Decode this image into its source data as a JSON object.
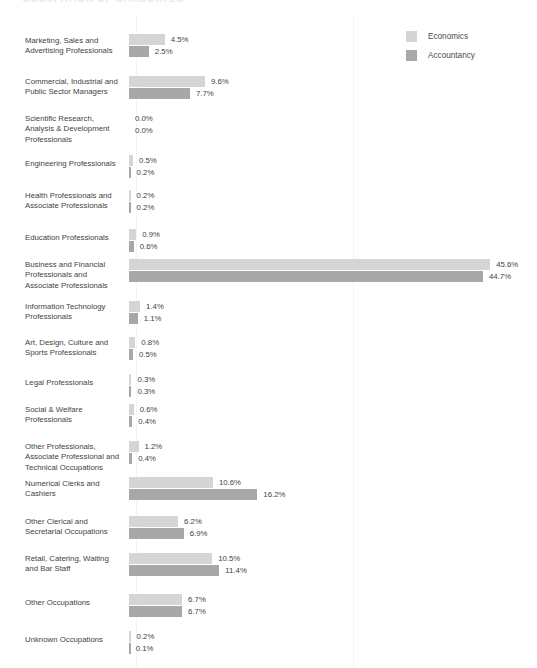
{
  "header": {
    "fragment_text": "OCCUPATION OF GRADUATES",
    "bullet_icon": "square-bullet-icon"
  },
  "legend": {
    "position": "top-right",
    "items": [
      {
        "label": "Economics",
        "color": "#d5d5d5",
        "swatch_icon": "legend-swatch-icon"
      },
      {
        "label": "Accountancy",
        "color": "#a8a8a8",
        "swatch_icon": "legend-swatch-icon"
      }
    ]
  },
  "chart_data": {
    "type": "bar",
    "orientation": "horizontal",
    "grouped": true,
    "title": "",
    "subtitle": "",
    "xlabel": "",
    "ylabel": "",
    "xlim": [
      0,
      50
    ],
    "grid": false,
    "legend_position": "top-right",
    "value_suffix": "%",
    "categories": [
      "Marketing, Sales and Advertising Professionals",
      "Commercial, Industrial and Public Sector Managers",
      "Scientific Research, Analysis & Development Professionals",
      "Engineering Professionals",
      "Health Professionals and Associate Professionals",
      "Education Professionals",
      "Business and Financial Professionals and Associate Professionals",
      "Information Technology Professionals",
      "Art, Design, Culture and Sports Professionals",
      "Legal Professionals",
      "Social & Welfare Professionals",
      "Other Professionals, Associate Professional and Technical Occupations",
      "Numerical Clerks and Cashiers",
      "Other Clerical and Secretarial Occupations",
      "Retail, Catering, Waiting and Bar Staff",
      "Other Occupations",
      "Unknown Occupations"
    ],
    "series": [
      {
        "name": "Economics",
        "color": "#d5d5d5",
        "values": [
          4.5,
          9.6,
          0.0,
          0.5,
          0.2,
          0.9,
          45.6,
          1.4,
          0.8,
          0.3,
          0.6,
          1.2,
          10.6,
          6.2,
          10.5,
          6.7,
          0.2
        ],
        "labels": [
          "4.5%",
          "9.6%",
          "0.0%",
          "0.5%",
          "0.2%",
          "0.9%",
          "45.6%",
          "1.4%",
          "0.8%",
          "0.3%",
          "0.6%",
          "1.2%",
          "10.6%",
          "6.2%",
          "10.5%",
          "6.7%",
          "0.2%"
        ]
      },
      {
        "name": "Accountancy",
        "color": "#a8a8a8",
        "values": [
          2.5,
          7.7,
          0.0,
          0.2,
          0.2,
          0.6,
          44.7,
          1.1,
          0.5,
          0.3,
          0.4,
          0.4,
          16.2,
          6.9,
          11.4,
          6.7,
          0.1
        ],
        "labels": [
          "2.5%",
          "7.7%",
          "0.0%",
          "0.2%",
          "0.2%",
          "0.6%",
          "44.7%",
          "1.1%",
          "0.5%",
          "0.3%",
          "0.4%",
          "0.4%",
          "16.2%",
          "6.9%",
          "11.4%",
          "6.7%",
          "0.1%"
        ]
      }
    ],
    "category_label_lines": [
      [
        "Marketing, Sales and",
        "Advertising Professionals"
      ],
      [
        "Commercial, Industrial and",
        "Public Sector Managers"
      ],
      [
        "Scientific Research,",
        "Analysis & Development",
        "Professionals"
      ],
      [
        "Engineering Professionals"
      ],
      [
        "Health Professionals and",
        "Associate Professionals"
      ],
      [
        "Education Professionals"
      ],
      [
        "Business and Financial",
        "Professionals and",
        "Associate Professionals"
      ],
      [
        "Information Technology",
        "Professionals"
      ],
      [
        "Art, Design, Culture and",
        "Sports Professionals"
      ],
      [
        "Legal Professionals"
      ],
      [
        "Social & Welfare",
        "Professionals"
      ],
      [
        "Other Professionals,",
        "Associate Professional and",
        "Technical Occupations"
      ],
      [
        "Numerical Clerks and",
        "Cashiers"
      ],
      [
        "Other Clerical and",
        "Secretarial Occupations"
      ],
      [
        "Retail, Catering, Waiting",
        "and Bar Staff"
      ],
      [
        "Other Occupations"
      ],
      [
        "Unknown Occupations"
      ]
    ]
  },
  "layout": {
    "row_tops": [
      20,
      62,
      99,
      141,
      176,
      215,
      245,
      287,
      323,
      360,
      390,
      427,
      463,
      502,
      539,
      580,
      617
    ],
    "label_tops": [
      22,
      63,
      100,
      145,
      177,
      219,
      246,
      288,
      324,
      364,
      391,
      428,
      465,
      503,
      540,
      584,
      621
    ],
    "px_per_unit": 7.92,
    "bar_start_x": 129
  }
}
